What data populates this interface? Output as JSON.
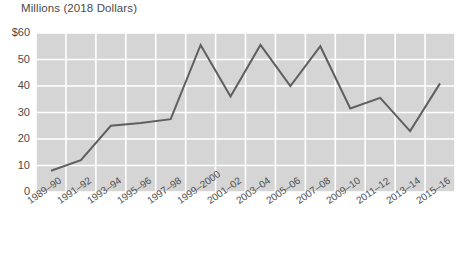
{
  "chart_data": {
    "type": "line",
    "title": "Millions (2018 Dollars)",
    "xlabel": "",
    "ylabel": "Millions (2018 Dollars)",
    "ylim": [
      0,
      60
    ],
    "yticks": [
      0,
      10,
      20,
      30,
      40,
      50,
      60
    ],
    "ytick_labels": [
      "0",
      "10",
      "20",
      "30",
      "40",
      "50",
      "$60"
    ],
    "grid": true,
    "legend": "none",
    "categories": [
      "1989–90",
      "1991–92",
      "1993–94",
      "1995–96",
      "1997–98",
      "1999–2000",
      "2001–02",
      "2003–04",
      "2005–06",
      "2007–08",
      "2009–10",
      "2011–12",
      "2013–14",
      "2015–16"
    ],
    "values": [
      8,
      12,
      25,
      26,
      27.5,
      55.5,
      36,
      55.5,
      40,
      55,
      31.5,
      35.5,
      23,
      41
    ],
    "series": [
      {
        "name": "Millions (2018 Dollars)",
        "values": [
          8,
          12,
          25,
          26,
          27.5,
          55.5,
          36,
          55.5,
          40,
          55,
          31.5,
          35.5,
          23,
          41
        ]
      }
    ],
    "colors": {
      "line": "#5f5f5f",
      "plot_background": "#d5d5d5",
      "gridline": "#ffffff",
      "page_background": "#ffffff",
      "text": "#4a4a4a"
    }
  }
}
